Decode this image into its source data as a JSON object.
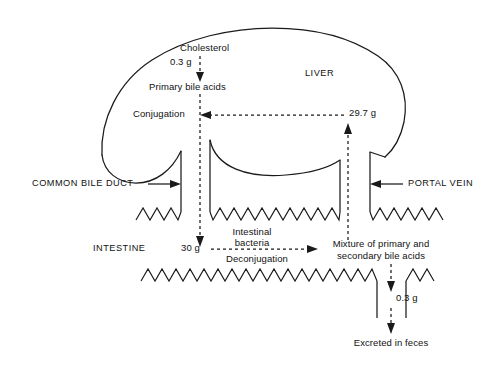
{
  "diagram": {
    "organs": {
      "liver_label": "LIVER",
      "intestine_label": "INTESTINE"
    },
    "vessels": {
      "common_bile_duct": "COMMON BILE DUCT",
      "portal_vein": "PORTAL VEIN"
    },
    "nodes": {
      "cholesterol": "Cholesterol",
      "cholesterol_amount": "0.3 g",
      "primary_bile_acids": "Primary bile acids",
      "conjugation": "Conjugation",
      "returned_amount": "29.7 g",
      "secreted_amount": "30 g",
      "intestinal_bacteria_line1": "Intestinal",
      "intestinal_bacteria_line2": "bacteria",
      "deconjugation": "Deconjugation",
      "mixture_line1": "Mixture of primary and",
      "mixture_line2": "secondary bile acids",
      "excreted_amount": "0.3 g",
      "excreted_in_feces": "Excreted in feces"
    },
    "colors": {
      "ink": "#1a1a1a",
      "background": "#ffffff"
    }
  }
}
